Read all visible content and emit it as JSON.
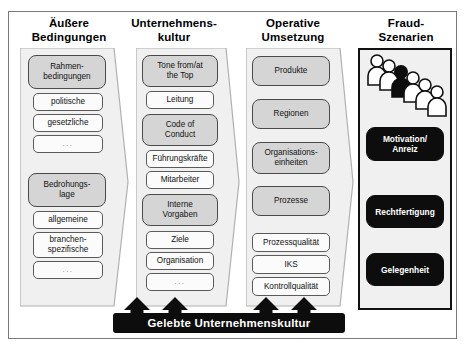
{
  "diagram": {
    "bottom_bar_label": "Gelebte Unternehmenskultur",
    "colors": {
      "grey_node": "#d5d5d5",
      "white_node": "#fbfbfb",
      "black_node": "#0d0d0d",
      "panel_fill": "#f0f0f0",
      "frame_border": "#7a7a7a"
    },
    "columns": [
      {
        "id": "aussere-bedingungen",
        "header_line1": "Äußere",
        "header_line2": "Bedingungen",
        "shape": "pointed-panel",
        "nodes": [
          {
            "label": "Rahmen-bedingungen",
            "line1": "Rahmen-",
            "line2": "bedingungen",
            "style": "grey"
          },
          {
            "label": "politische",
            "line1": "politische",
            "line2": "",
            "style": "white"
          },
          {
            "label": "gesetzliche",
            "line1": "gesetzliche",
            "line2": "",
            "style": "white"
          },
          {
            "label": "...",
            "line1": "...",
            "line2": "",
            "style": "white-dots"
          },
          {
            "label": "Bedrohungs-lage",
            "line1": "Bedrohungs-",
            "line2": "lage",
            "style": "grey"
          },
          {
            "label": "allgemeine",
            "line1": "allgemeine",
            "line2": "",
            "style": "white"
          },
          {
            "label": "branchen-spezifische",
            "line1": "branchen-",
            "line2": "spezifische",
            "style": "white"
          },
          {
            "label": "...",
            "line1": "...",
            "line2": "",
            "style": "white-dots"
          }
        ]
      },
      {
        "id": "unternehmenskultur",
        "header_line1": "Unternehmens-",
        "header_line2": "kultur",
        "shape": "pointed-panel",
        "nodes": [
          {
            "label": "Tone from/at the Top",
            "line1": "Tone from/at",
            "line2": "the Top",
            "style": "grey"
          },
          {
            "label": "Leitung",
            "line1": "Leitung",
            "line2": "",
            "style": "white"
          },
          {
            "label": "Code of Conduct",
            "line1": "Code of",
            "line2": "Conduct",
            "style": "grey"
          },
          {
            "label": "Führungskräfte",
            "line1": "Führungskräfte",
            "line2": "",
            "style": "white"
          },
          {
            "label": "Mitarbeiter",
            "line1": "Mitarbeiter",
            "line2": "",
            "style": "white"
          },
          {
            "label": "Interne Vorgaben",
            "line1": "Interne",
            "line2": "Vorgaben",
            "style": "grey"
          },
          {
            "label": "Ziele",
            "line1": "Ziele",
            "line2": "",
            "style": "white"
          },
          {
            "label": "Organisation",
            "line1": "Organisation",
            "line2": "",
            "style": "white"
          },
          {
            "label": "...",
            "line1": "...",
            "line2": "",
            "style": "white-dots"
          }
        ]
      },
      {
        "id": "operative-umsetzung",
        "header_line1": "Operative",
        "header_line2": "Umsetzung",
        "shape": "pointed-panel",
        "nodes": [
          {
            "label": "Produkte",
            "line1": "Produkte",
            "line2": "",
            "style": "grey"
          },
          {
            "label": "Regionen",
            "line1": "Regionen",
            "line2": "",
            "style": "grey"
          },
          {
            "label": "Organisations-einheiten",
            "line1": "Organisations-",
            "line2": "einheiten",
            "style": "grey"
          },
          {
            "label": "Prozesse",
            "line1": "Prozesse",
            "line2": "",
            "style": "grey"
          },
          {
            "label": "Prozessqualität",
            "line1": "Prozessqualität",
            "line2": "",
            "style": "white"
          },
          {
            "label": "IKS",
            "line1": "IKS",
            "line2": "",
            "style": "white"
          },
          {
            "label": "Kontrollqualität",
            "line1": "Kontrollqualität",
            "line2": "",
            "style": "white"
          }
        ]
      },
      {
        "id": "fraud-szenarien",
        "header_line1": "Fraud-",
        "header_line2": "Szenarien",
        "shape": "rectangle",
        "illustration": "people-row-icon",
        "nodes": [
          {
            "label": "Motivation/ Anreiz",
            "line1": "Motivation/",
            "line2": "Anreiz",
            "style": "black"
          },
          {
            "label": "Rechtfertigung",
            "line1": "Rechtfertigung",
            "line2": "",
            "style": "black"
          },
          {
            "label": "Gelegenheit",
            "line1": "Gelegenheit",
            "line2": "",
            "style": "black"
          }
        ]
      }
    ],
    "arrows": {
      "count": 4,
      "direction": "up",
      "name": "upward-arrow"
    }
  }
}
